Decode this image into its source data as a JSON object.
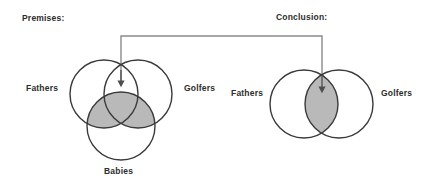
{
  "figure": {
    "title_premises": "Premises:",
    "title_conclusion": "Conclusion:",
    "premises_diagram": {
      "type": "venn-3",
      "sets": [
        {
          "id": "fathers",
          "label": "Fathers",
          "cx": 104,
          "cy": 94,
          "r": 34
        },
        {
          "id": "golfers",
          "label": "Golfers",
          "cx": 138,
          "cy": 94,
          "r": 34
        },
        {
          "id": "babies",
          "label": "Babies",
          "cx": 121,
          "cy": 126,
          "r": 34
        }
      ],
      "shaded_regions": [
        "fathers-and-babies",
        "golfers-and-babies"
      ],
      "arrow_target": "fathers-and-golfers"
    },
    "conclusion_diagram": {
      "type": "venn-2",
      "sets": [
        {
          "id": "fathers",
          "label": "Fathers",
          "cx": 304,
          "cy": 104,
          "r": 34
        },
        {
          "id": "golfers",
          "label": "Golfers",
          "cx": 339,
          "cy": 104,
          "r": 34
        }
      ],
      "shaded_regions": [
        "fathers-and-golfers"
      ],
      "arrow_target": "fathers-and-golfers"
    },
    "connector": {
      "name": "premises-to-conclusion-connector",
      "left_x": 121,
      "right_x": 322,
      "top_y": 36,
      "left_arrow_tip_y": 84,
      "right_arrow_tip_y": 90
    },
    "colors": {
      "circle_stroke": "#3a3a3a",
      "shade_fill": "#b9b9b9",
      "connector_stroke": "#8a8a8a",
      "arrow_stroke": "#555555",
      "text": "#2d2d2d",
      "background": "#ffffff"
    }
  }
}
